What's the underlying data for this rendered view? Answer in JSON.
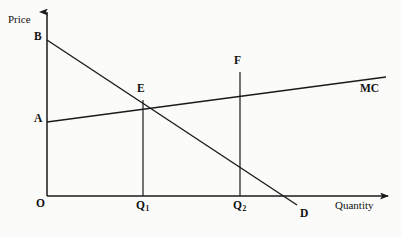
{
  "figure": {
    "kind": "economics-supply-demand-diagram",
    "background_color": "#fbfbfa",
    "line_color": "#1a1a1a",
    "text_color": "#111111"
  },
  "axes": {
    "y_label": "Price",
    "x_label": "Quantity",
    "origin_label": "O",
    "x_axis": {
      "x_start": 47,
      "x_end": 390,
      "y": 196
    },
    "y_axis": {
      "x": 47,
      "y_top": 10,
      "y_bottom": 196
    }
  },
  "curves": [
    {
      "name": "demand",
      "label": "D",
      "label_x": 300,
      "label_y": 210,
      "intercept_label": "B",
      "x1": 47,
      "y1": 40,
      "x2": 297,
      "y2": 205
    },
    {
      "name": "marginal-cost",
      "label": "MC",
      "label_x": 360,
      "label_y": 83,
      "intercept_label": "A",
      "x1": 47,
      "y1": 122,
      "x2": 386,
      "y2": 77
    }
  ],
  "points": [
    {
      "id": "B",
      "label": "B",
      "label_x": 34,
      "label_y": 34,
      "x": 47,
      "y": 40
    },
    {
      "id": "A",
      "label": "A",
      "label_x": 34,
      "label_y": 116,
      "x": 47,
      "y": 122
    },
    {
      "id": "E",
      "label": "E",
      "label_x": 137,
      "label_y": 86,
      "x": 143,
      "y": 100
    },
    {
      "id": "F",
      "label": "F",
      "label_x": 234,
      "label_y": 58,
      "x": 240,
      "y": 72
    }
  ],
  "drop_lines": [
    {
      "from_point": "E",
      "x": 143,
      "y_top": 100,
      "y_bottom": 196,
      "tick_label": "Q",
      "tick_sub": "1"
    },
    {
      "from_point": "F",
      "x": 240,
      "y_top": 72,
      "y_bottom": 196,
      "tick_label": "Q",
      "tick_sub": "2"
    }
  ],
  "x_ticks": [
    {
      "label": "Q",
      "sub": "1",
      "label_x": 136,
      "label_y": 203
    },
    {
      "label": "Q",
      "sub": "2",
      "label_x": 233,
      "label_y": 203
    }
  ],
  "horizontal_lines": [
    {
      "name": "price-A-level",
      "x1": 47,
      "y1": 122,
      "x2": 143,
      "y2": 100
    }
  ]
}
